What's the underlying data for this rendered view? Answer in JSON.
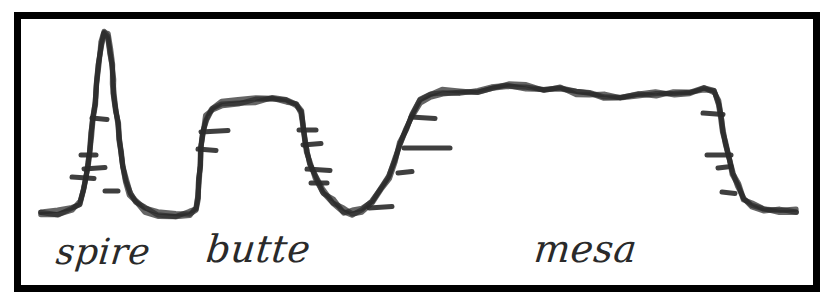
{
  "figure": {
    "title": "",
    "background_color": "#ffffff",
    "ink_color": "#2a2a2a",
    "frame": {
      "border_color": "#000000",
      "border_width": 7,
      "x": 14,
      "y": 12,
      "width": 806,
      "height": 280
    }
  },
  "labels": [
    {
      "id": "spire",
      "text": "spire",
      "x": 55,
      "y": 264,
      "font_size": 36
    },
    {
      "id": "butte",
      "text": "butte",
      "x": 205,
      "y": 262,
      "font_size": 38
    },
    {
      "id": "mesa",
      "text": "mesa",
      "x": 533,
      "y": 262,
      "font_size": 38
    }
  ],
  "chart_data": {
    "type": "line",
    "xlabel": "",
    "ylabel": "",
    "grid": false,
    "legend_position": "none",
    "note": "Hand-drawn silhouette profile of three sandstone erosional remnants drawn as one continuous skyline outline; short horizontal ticks mark rock strata layers on the cliff faces.",
    "xlim": [
      20,
      820
    ],
    "ylim": [
      230,
      25
    ],
    "series": [
      {
        "name": "skyline-profile",
        "points": [
          [
            41,
            214
          ],
          [
            58,
            213
          ],
          [
            72,
            210
          ],
          [
            80,
            203
          ],
          [
            84,
            190
          ],
          [
            86,
            176
          ],
          [
            88,
            163
          ],
          [
            90,
            150
          ],
          [
            91,
            136
          ],
          [
            93,
            120
          ],
          [
            95,
            104
          ],
          [
            97,
            84
          ],
          [
            99,
            62
          ],
          [
            101,
            44
          ],
          [
            104,
            32
          ],
          [
            108,
            36
          ],
          [
            110,
            50
          ],
          [
            112,
            66
          ],
          [
            113,
            82
          ],
          [
            114,
            96
          ],
          [
            116,
            110
          ],
          [
            118,
            124
          ],
          [
            119,
            138
          ],
          [
            121,
            152
          ],
          [
            123,
            166
          ],
          [
            126,
            180
          ],
          [
            130,
            192
          ],
          [
            136,
            202
          ],
          [
            145,
            209
          ],
          [
            158,
            213
          ],
          [
            176,
            214
          ],
          [
            190,
            214
          ],
          [
            196,
            209
          ],
          [
            198,
            196
          ],
          [
            199,
            180
          ],
          [
            200,
            164
          ],
          [
            201,
            148
          ],
          [
            203,
            132
          ],
          [
            206,
            118
          ],
          [
            212,
            108
          ],
          [
            222,
            103
          ],
          [
            238,
            101
          ],
          [
            256,
            100
          ],
          [
            272,
            100
          ],
          [
            286,
            100
          ],
          [
            296,
            103
          ],
          [
            301,
            112
          ],
          [
            303,
            126
          ],
          [
            305,
            140
          ],
          [
            307,
            152
          ],
          [
            310,
            164
          ],
          [
            315,
            176
          ],
          [
            323,
            190
          ],
          [
            333,
            202
          ],
          [
            343,
            210
          ],
          [
            352,
            213
          ],
          [
            362,
            211
          ],
          [
            372,
            203
          ],
          [
            381,
            190
          ],
          [
            389,
            176
          ],
          [
            395,
            160
          ],
          [
            400,
            144
          ],
          [
            406,
            128
          ],
          [
            412,
            114
          ],
          [
            420,
            102
          ],
          [
            430,
            94
          ],
          [
            442,
            91
          ],
          [
            460,
            91
          ],
          [
            478,
            91
          ],
          [
            492,
            89
          ],
          [
            508,
            87
          ],
          [
            526,
            87
          ],
          [
            544,
            88
          ],
          [
            560,
            90
          ],
          [
            576,
            93
          ],
          [
            590,
            95
          ],
          [
            604,
            97
          ],
          [
            620,
            96
          ],
          [
            638,
            95
          ],
          [
            656,
            94
          ],
          [
            674,
            93
          ],
          [
            690,
            91
          ],
          [
            704,
            88
          ],
          [
            714,
            91
          ],
          [
            719,
            102
          ],
          [
            721,
            116
          ],
          [
            723,
            130
          ],
          [
            726,
            144
          ],
          [
            729,
            158
          ],
          [
            733,
            172
          ],
          [
            738,
            186
          ],
          [
            744,
            198
          ],
          [
            752,
            206
          ],
          [
            764,
            210
          ],
          [
            780,
            211
          ],
          [
            796,
            211
          ]
        ]
      }
    ],
    "strata_ticks": [
      {
        "landform": "spire",
        "x1": 92,
        "x2": 107,
        "y": 119
      },
      {
        "landform": "spire",
        "x1": 81,
        "x2": 96,
        "y": 155
      },
      {
        "landform": "spire",
        "x1": 84,
        "x2": 105,
        "y": 168
      },
      {
        "landform": "spire",
        "x1": 72,
        "x2": 94,
        "y": 178
      },
      {
        "landform": "spire",
        "x1": 105,
        "x2": 118,
        "y": 191
      },
      {
        "landform": "butte",
        "x1": 201,
        "x2": 228,
        "y": 131
      },
      {
        "landform": "butte",
        "x1": 198,
        "x2": 216,
        "y": 150
      },
      {
        "landform": "butte",
        "x1": 299,
        "x2": 316,
        "y": 130
      },
      {
        "landform": "butte",
        "x1": 303,
        "x2": 321,
        "y": 144
      },
      {
        "landform": "butte",
        "x1": 307,
        "x2": 330,
        "y": 170
      },
      {
        "landform": "butte",
        "x1": 311,
        "x2": 327,
        "y": 183
      },
      {
        "landform": "butte",
        "x1": 369,
        "x2": 392,
        "y": 207
      },
      {
        "landform": "mesa",
        "x1": 411,
        "x2": 435,
        "y": 118
      },
      {
        "landform": "mesa",
        "x1": 404,
        "x2": 450,
        "y": 148
      },
      {
        "landform": "mesa",
        "x1": 398,
        "x2": 412,
        "y": 172
      },
      {
        "landform": "mesa",
        "x1": 703,
        "x2": 723,
        "y": 114
      },
      {
        "landform": "mesa",
        "x1": 707,
        "x2": 731,
        "y": 155
      },
      {
        "landform": "mesa",
        "x1": 718,
        "x2": 731,
        "y": 167
      },
      {
        "landform": "mesa",
        "x1": 722,
        "x2": 735,
        "y": 193
      }
    ]
  }
}
